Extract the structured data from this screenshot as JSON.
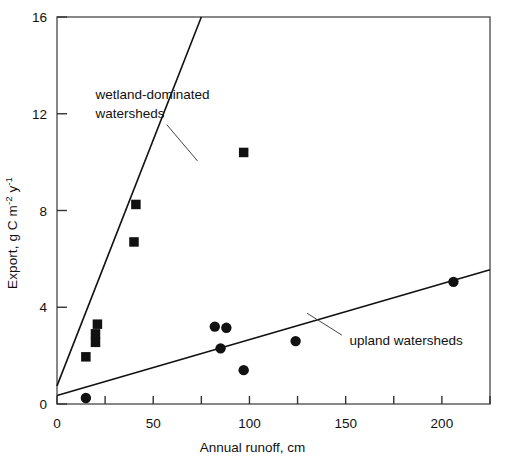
{
  "chart_data": {
    "type": "scatter",
    "title": "",
    "xlabel": "Annual runoff, cm",
    "ylabel": "Export, g C m-2 y-1",
    "ylabel_parts": {
      "pre": "Export, g C m",
      "sup1": "-2",
      "mid": " y",
      "sup2": "-1"
    },
    "xlim": [
      0,
      225
    ],
    "ylim": [
      0,
      16
    ],
    "xticks": [
      0,
      25,
      50,
      75,
      100,
      125,
      150,
      175,
      200,
      225
    ],
    "xtick_labels": [
      "0",
      "",
      "50",
      "",
      "100",
      "",
      "150",
      "",
      "200",
      ""
    ],
    "yticks": [
      0,
      4,
      8,
      12,
      16
    ],
    "ytick_labels": [
      "0",
      "4",
      "8",
      "12",
      "16"
    ],
    "grid": false,
    "legend_position": "in-plot-annotations",
    "series": [
      {
        "name": "wetland-dominated watersheds",
        "marker": "square",
        "color": "#111111",
        "points": [
          {
            "x": 15,
            "y": 1.95
          },
          {
            "x": 20,
            "y": 2.55
          },
          {
            "x": 20,
            "y": 2.9
          },
          {
            "x": 21,
            "y": 3.3
          },
          {
            "x": 40,
            "y": 6.7
          },
          {
            "x": 41,
            "y": 8.25
          },
          {
            "x": 97,
            "y": 10.4
          }
        ],
        "fit_line": {
          "x0": 0,
          "y0": 0.75,
          "x1": 75,
          "y1": 16.0
        }
      },
      {
        "name": "upland watersheds",
        "marker": "circle",
        "color": "#111111",
        "points": [
          {
            "x": 15,
            "y": 0.25
          },
          {
            "x": 82,
            "y": 3.2
          },
          {
            "x": 88,
            "y": 3.15
          },
          {
            "x": 85,
            "y": 2.3
          },
          {
            "x": 97,
            "y": 1.4
          },
          {
            "x": 124,
            "y": 2.6
          },
          {
            "x": 206,
            "y": 5.05
          }
        ],
        "fit_line": {
          "x0": 0,
          "y0": 0.35,
          "x1": 225,
          "y1": 5.55
        }
      }
    ],
    "annotations": [
      {
        "id": "wetland-annotation",
        "text_line1": "wetland-dominated",
        "text_line2": "watersheds",
        "text_x": 20,
        "text_y": 12.6,
        "leader": {
          "x0": 57,
          "y0": 11.55,
          "x1": 73,
          "y1": 10.05
        }
      },
      {
        "id": "upland-annotation",
        "text_line1": "upland watersheds",
        "text_line2": "",
        "text_x": 152,
        "text_y": 2.45,
        "leader": {
          "x0": 148,
          "y0": 2.85,
          "x1": 130,
          "y1": 3.75
        }
      }
    ]
  }
}
